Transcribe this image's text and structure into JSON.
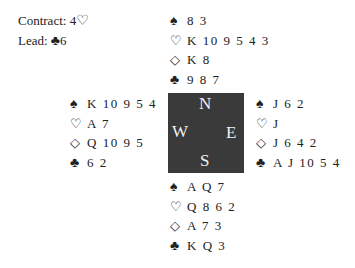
{
  "info": {
    "contract_label": "Contract: 4",
    "contract_suit": "♡",
    "lead_label": "Lead: ",
    "lead_suit": "♣",
    "lead_card": "6"
  },
  "symbols": {
    "spades": "♠",
    "hearts": "♡",
    "diamonds": "◇",
    "clubs": "♣"
  },
  "hands": {
    "north": {
      "spades": "8 3",
      "hearts": "K 10 9 5 4 3",
      "diamonds": "K 8",
      "clubs": "9 8 7"
    },
    "west": {
      "spades": "K 10 9 5 4",
      "hearts": "A 7",
      "diamonds": "Q 10 9 5",
      "clubs": "6 2"
    },
    "east": {
      "spades": "J 6 2",
      "hearts": "J",
      "diamonds": "J 6 4 2",
      "clubs": "A J 10 5 4"
    },
    "south": {
      "spades": "A Q 7",
      "hearts": "Q 8 6 2",
      "diamonds": "A 7 3",
      "clubs": "K Q 3"
    }
  },
  "compass": {
    "n": "N",
    "s": "S",
    "e": "E",
    "w": "W",
    "bg": "#3a3a3a"
  }
}
